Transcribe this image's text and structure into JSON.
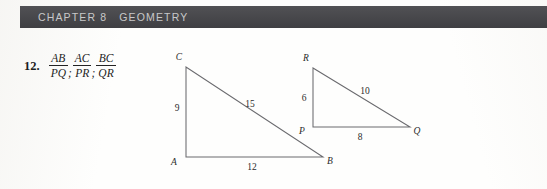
{
  "page": {
    "background_color": "#fdfdfc",
    "width": 547,
    "height": 189
  },
  "running_head": {
    "chapter_label": "CHAPTER 8",
    "title": "GEOMETRY",
    "bar_color": "#46464a",
    "text_color": "#c8c8c9"
  },
  "exercise": {
    "number": "12.",
    "separator": ";",
    "fractions": [
      {
        "numerator": "AB",
        "denominator": "PQ"
      },
      {
        "numerator": "AC",
        "denominator": "PR"
      },
      {
        "numerator": "BC",
        "denominator": "QR"
      }
    ]
  },
  "figures": [
    {
      "name": "triangle-abc",
      "vertices": [
        {
          "label": "C",
          "x": 186,
          "y": 67,
          "label_x": 179,
          "label_y": 60
        },
        {
          "label": "A",
          "x": 186,
          "y": 157,
          "label_x": 174,
          "label_y": 165
        },
        {
          "label": "B",
          "x": 323,
          "y": 157,
          "label_x": 327,
          "label_y": 164
        }
      ],
      "measures": [
        {
          "value": "9",
          "x": 177,
          "y": 111
        },
        {
          "value": "12",
          "x": 250,
          "y": 170
        },
        {
          "value": "15",
          "x": 247,
          "y": 107
        }
      ]
    },
    {
      "name": "triangle-pqr",
      "vertices": [
        {
          "label": "R",
          "x": 313,
          "y": 68,
          "label_x": 306,
          "label_y": 61
        },
        {
          "label": "P",
          "x": 313,
          "y": 127,
          "label_x": 301,
          "label_y": 134
        },
        {
          "label": "Q",
          "x": 410,
          "y": 127,
          "label_x": 414,
          "label_y": 134
        }
      ],
      "measures": [
        {
          "value": "6",
          "x": 303,
          "y": 101
        },
        {
          "value": "8",
          "x": 358,
          "y": 140
        },
        {
          "value": "10",
          "x": 362,
          "y": 94
        }
      ]
    }
  ]
}
